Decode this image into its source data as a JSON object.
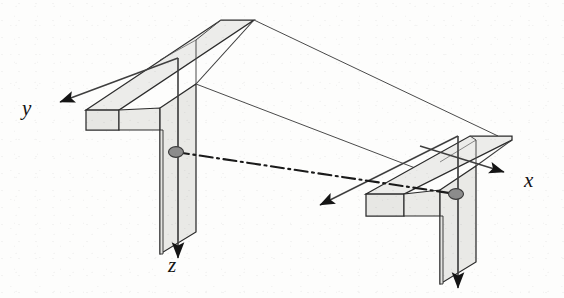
{
  "figure": {
    "kind": "engineering-diagram",
    "background_color": "#fdfdfc"
  },
  "axes": {
    "x": {
      "label": "x",
      "direction": "right-down",
      "arrow": "filled-triangle"
    },
    "y": {
      "label": "y",
      "direction": "left-up",
      "arrow": "filled-triangle"
    },
    "z": {
      "label": "z",
      "direction": "down",
      "arrow": "filled-triangle"
    }
  },
  "sections": [
    {
      "name": "left-section",
      "fill": "#ebebe8",
      "stroke": "#2b2b2b",
      "shear_center": {
        "x": 176,
        "y": 152
      }
    },
    {
      "name": "right-section",
      "fill": "#ebebe8",
      "stroke": "#2b2b2b",
      "shear_center": {
        "x": 456,
        "y": 194
      }
    }
  ],
  "centerline": {
    "name": "shear-center-axis",
    "style": "dash-dot",
    "stroke": "#1a1a1a",
    "from": {
      "x": 176,
      "y": 152
    },
    "to": {
      "x": 456,
      "y": 194
    }
  },
  "colors": {
    "stroke": "#2b2b2b",
    "thin_stroke": "#4a4a4a",
    "flange_fill": "#ebebe8",
    "web_fill": "#e6e6e3",
    "dot_fill": "#8c8c8c",
    "dot_stroke": "#3a3a3a",
    "arrow_fill": "#151515",
    "label_color": "#141414"
  }
}
